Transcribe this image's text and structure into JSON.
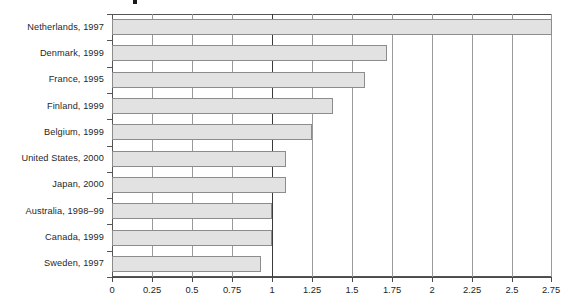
{
  "chart": {
    "type": "bar",
    "orientation": "horizontal",
    "bar_fill_color": "#e2e2e2",
    "bar_border_color": "#8c8c8c",
    "gridline_color": "#9a9a9a",
    "reference_line_color": "#3a3a3a",
    "axis_color": "#4a4a4a"
  },
  "chart_data": {
    "type": "bar",
    "title": "",
    "xlabel": "",
    "ylabel": "",
    "orientation": "horizontal",
    "categories": [
      "Netherlands, 1997",
      "Denmark, 1999",
      "France, 1995",
      "Finland, 1999",
      "Belgium, 1999",
      "United States, 2000",
      "Japan, 2000",
      "Australia, 1998–99",
      "Canada, 1999",
      "Sweden, 1997"
    ],
    "values": [
      2.75,
      1.72,
      1.58,
      1.38,
      1.25,
      1.09,
      1.09,
      1.0,
      1.0,
      0.93
    ],
    "xlim": [
      0,
      2.75
    ],
    "xticks": [
      0,
      0.25,
      0.5,
      0.75,
      1,
      1.25,
      1.5,
      1.75,
      2,
      2.25,
      2.5,
      2.75
    ],
    "xtick_labels": [
      "0",
      "0.25",
      "0.5",
      "0.75",
      "1",
      "1.25",
      "1.5",
      "1.75",
      "2",
      "2.25",
      "2.5",
      "2.75"
    ],
    "grid": true,
    "reference_line": 1,
    "legend": null,
    "annotations": []
  }
}
